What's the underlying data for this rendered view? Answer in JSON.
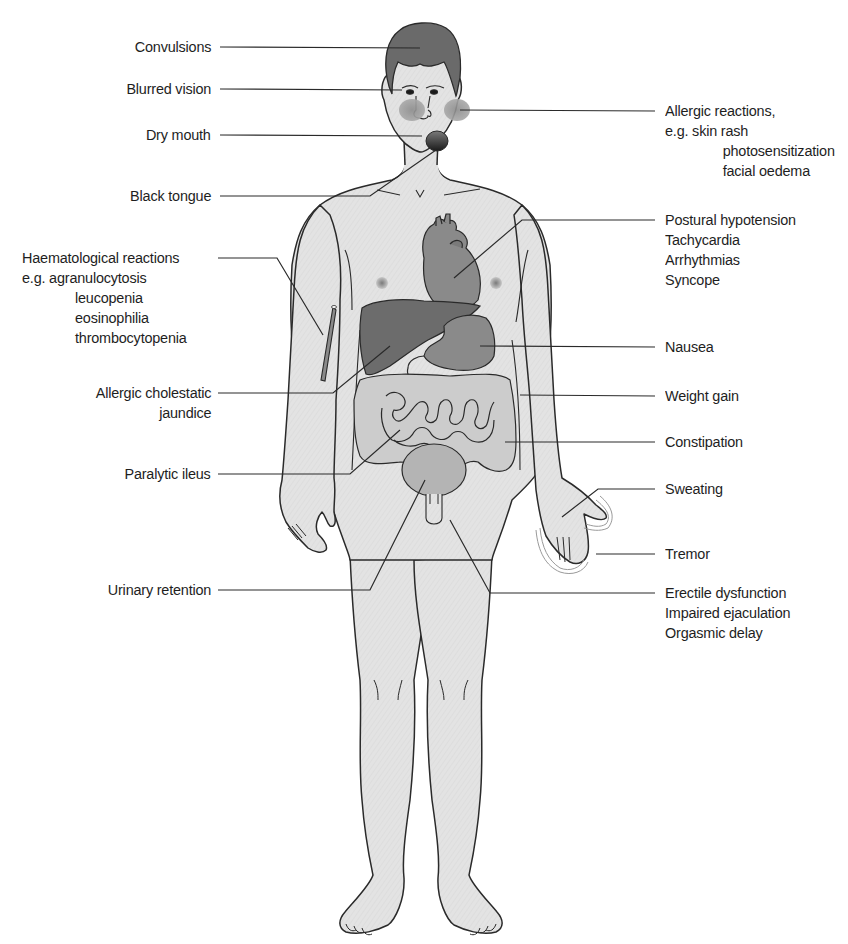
{
  "figure": {
    "colors": {
      "skin": "#e2e2e2",
      "outline": "#2a2a2a",
      "hair": "#6a6a6a",
      "organ_dark": "#6c6c6c",
      "organ_mid": "#8a8a8a",
      "organ_light": "#b4b4b4",
      "leader_line": "#2a2a2a",
      "text": "#1e1e1e"
    }
  },
  "labels_left": [
    {
      "id": "convulsions",
      "lines": [
        "Convulsions"
      ]
    },
    {
      "id": "blurred-vision",
      "lines": [
        "Blurred vision"
      ]
    },
    {
      "id": "dry-mouth",
      "lines": [
        "Dry mouth"
      ]
    },
    {
      "id": "black-tongue",
      "lines": [
        "Black tongue"
      ]
    },
    {
      "id": "haematological-reactions",
      "lines": [
        "Haematological reactions",
        "e.g. agranulocytosis",
        "leucopenia",
        "eosinophilia",
        "thrombocytopenia"
      ]
    },
    {
      "id": "allergic-cholestatic-jaundice",
      "lines": [
        "Allergic cholestatic",
        "jaundice"
      ]
    },
    {
      "id": "paralytic-ileus",
      "lines": [
        "Paralytic ileus"
      ]
    },
    {
      "id": "urinary-retention",
      "lines": [
        "Urinary retention"
      ]
    }
  ],
  "labels_right": [
    {
      "id": "allergic-reactions",
      "lines": [
        "Allergic reactions,",
        "e.g. skin rash",
        "photosensitization",
        "facial oedema"
      ]
    },
    {
      "id": "cardiovascular",
      "lines": [
        "Postural hypotension",
        "Tachycardia",
        "Arrhythmias",
        "Syncope"
      ]
    },
    {
      "id": "nausea",
      "lines": [
        "Nausea"
      ]
    },
    {
      "id": "weight-gain",
      "lines": [
        "Weight gain"
      ]
    },
    {
      "id": "constipation",
      "lines": [
        "Constipation"
      ]
    },
    {
      "id": "sweating",
      "lines": [
        "Sweating"
      ]
    },
    {
      "id": "tremor",
      "lines": [
        "Tremor"
      ]
    },
    {
      "id": "sexual-dysfunction",
      "lines": [
        "Erectile dysfunction",
        "Impaired ejaculation",
        "Orgasmic delay"
      ]
    }
  ]
}
